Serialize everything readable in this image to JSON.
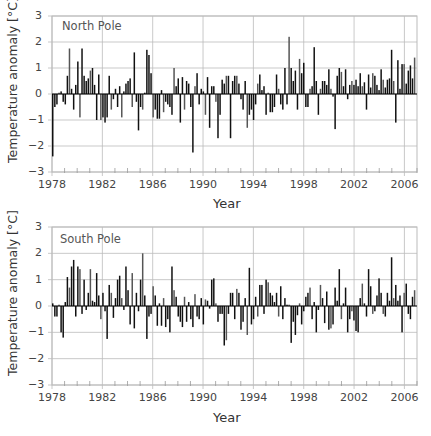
{
  "chart_data": [
    {
      "type": "bar",
      "title": "North Pole",
      "xlabel": "Year",
      "ylabel": "Temperature anomaly [°C]",
      "ylim": [
        -3,
        3
      ],
      "xlim": [
        1978,
        2007
      ],
      "grid": true,
      "x_ticks": [
        "1978",
        "1982",
        "1986",
        "1990",
        "1994",
        "1998",
        "2002",
        "2006"
      ],
      "y_ticks": [
        "3",
        "2",
        "1",
        "0",
        "−1",
        "−2",
        "−3"
      ],
      "resolution": "bimonthly (6 values per year, 1978–2006)",
      "values": [
        -2.4,
        -0.5,
        -0.4,
        0.05,
        0.1,
        -0.3,
        -0.4,
        0.7,
        1.75,
        0.2,
        -0.6,
        0.35,
        1.25,
        -0.9,
        1.75,
        0.7,
        0.5,
        0.6,
        0.9,
        1.0,
        0.35,
        -1.0,
        0.75,
        -1.0,
        -0.9,
        -1.1,
        -0.9,
        0.7,
        -0.6,
        -0.2,
        0.2,
        -0.5,
        0.3,
        -0.9,
        0.1,
        0.4,
        0.5,
        0.6,
        -0.5,
        1.6,
        -0.3,
        -1.4,
        -0.5,
        -0.6,
        0.05,
        1.7,
        1.5,
        0.8,
        -0.9,
        -0.6,
        -0.95,
        -0.95,
        0.15,
        -0.7,
        -0.3,
        -0.4,
        -0.5,
        -0.8,
        1.0,
        0.3,
        0.6,
        -1.1,
        0.65,
        -0.6,
        0.5,
        0.4,
        -0.5,
        -2.25,
        0.3,
        0.8,
        -0.4,
        0.2,
        0.1,
        -0.8,
        0.65,
        -1.3,
        0.3,
        0.3,
        -0.3,
        -1.7,
        -0.8,
        0.55,
        0.4,
        0.7,
        0.7,
        -1.7,
        0.5,
        0.7,
        0.7,
        0.4,
        -0.2,
        -0.6,
        0.5,
        -1.3,
        -0.8,
        -0.6,
        -1.0,
        -0.4,
        0.4,
        0.75,
        0.15,
        0.3,
        -0.8,
        0.05,
        -0.7,
        -0.7,
        -0.5,
        0.75,
        0.2,
        -0.4,
        -0.6,
        1.0,
        -0.4,
        2.2,
        1.0,
        0.5,
        0.9,
        -0.6,
        1.35,
        0.8,
        1.2,
        -0.5,
        -0.5,
        0.2,
        0.3,
        1.8,
        0.5,
        -0.8,
        0.2,
        0.5,
        0.5,
        0.35,
        0.95,
        0.2,
        -0.1,
        -1.35,
        0.7,
        1.0,
        0.85,
        0.3,
        0.95,
        -0.2,
        0.35,
        0.5,
        0.35,
        0.55,
        0.3,
        0.8,
        0.3,
        0.45,
        -0.6,
        0.75,
        0.25,
        0.8,
        0.7,
        0.35,
        0.15,
        0.95,
        0.55,
        0.25,
        0.55,
        0.6,
        1.7,
        0.5,
        -1.1,
        1.3,
        0.2,
        1.15,
        1.15,
        0.4,
        0.9,
        1.1,
        0.6,
        1.4
      ]
    },
    {
      "type": "bar",
      "title": "South Pole",
      "xlabel": "Year",
      "ylabel": "Temperature anomaly [°C]",
      "ylim": [
        -3,
        3
      ],
      "xlim": [
        1978,
        2007
      ],
      "grid": true,
      "x_ticks": [
        "1978",
        "1982",
        "1986",
        "1990",
        "1994",
        "1998",
        "2002",
        "2006"
      ],
      "y_ticks": [
        "3",
        "2",
        "1",
        "0",
        "−1",
        "−2",
        "−3"
      ],
      "resolution": "bimonthly (6 values per year, 1978–2006)",
      "values": [
        0.1,
        -0.4,
        -0.4,
        0.05,
        -1.0,
        -1.2,
        0.15,
        1.1,
        0.7,
        1.5,
        1.75,
        -0.4,
        1.5,
        1.4,
        -0.3,
        1.0,
        -0.15,
        0.5,
        1.4,
        0.2,
        0.15,
        1.25,
        0.4,
        -0.5,
        0.5,
        -0.2,
        -1.25,
        0.8,
        0.5,
        -0.45,
        0.3,
        1.0,
        1.15,
        0.3,
        -0.15,
        1.5,
        0.6,
        -0.7,
        1.25,
        -0.85,
        0.5,
        -0.2,
        1.0,
        2.0,
        0.4,
        -1.25,
        -0.4,
        -0.3,
        0.75,
        0.4,
        -0.75,
        0.1,
        -0.75,
        0.3,
        -0.8,
        -0.5,
        -1.0,
        1.5,
        0.6,
        0.35,
        -0.4,
        -0.6,
        -0.8,
        0.35,
        -0.6,
        0.15,
        -0.5,
        -0.8,
        0.45,
        -0.4,
        -0.5,
        0.3,
        -0.7,
        0.25,
        0.2,
        -0.1,
        1.0,
        1.05,
        0.1,
        -0.6,
        -0.3,
        -0.3,
        -1.5,
        -1.3,
        -0.3,
        0.5,
        0.5,
        -0.5,
        0.65,
        0.5,
        -0.9,
        -0.6,
        0.3,
        -1.1,
        1.45,
        -0.7,
        -0.5,
        0.35,
        -0.4,
        0.8,
        0.8,
        -0.3,
        1.0,
        0.9,
        0.5,
        0.4,
        0.15,
        0.5,
        -0.4,
        0.75,
        -0.5,
        0.3,
        0.05,
        0.05,
        -1.4,
        -0.6,
        -1.1,
        -0.35,
        0.1,
        -0.7,
        -0.2,
        0.35,
        0.5,
        0.7,
        -0.5,
        0.15,
        -1.0,
        -0.15,
        0.8,
        0.3,
        -0.65,
        0.55,
        -0.9,
        -0.85,
        -0.7,
        0.7,
        0.2,
        1.4,
        -0.5,
        0.1,
        0.7,
        -1.0,
        -0.5,
        -0.2,
        -0.55,
        -0.95,
        -1.0,
        0.3,
        0.85,
        0.1,
        -0.4,
        1.4,
        0.75,
        -0.3,
        -0.2,
        0.4,
        1.05,
        0.5,
        -0.3,
        -0.4,
        0.5,
        0.2,
        1.85,
        0.3,
        0.8,
        0.2,
        0.4,
        -1.0,
        0.5,
        0.85,
        -0.3,
        -0.5,
        0.35,
        0.6
      ]
    }
  ],
  "panels": [
    {
      "title": "North Pole",
      "ylabel": "Temperature anomaly [°C]",
      "xlabel": "Year"
    },
    {
      "title": "South Pole",
      "ylabel": "Temperature anomaly [°C]",
      "xlabel": "Year"
    }
  ]
}
